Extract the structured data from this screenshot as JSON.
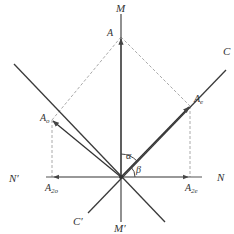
{
  "diagram": {
    "type": "vector-projection",
    "colors": {
      "line": "#3a3a3a",
      "axis": "#555555",
      "dashed": "#aaaaaa",
      "text": "#333333"
    },
    "labels": {
      "M": "M",
      "M_prime": "M′",
      "N": "N",
      "N_prime": "N′",
      "C": "C",
      "C_prime": "C′",
      "A": "A",
      "A_e": "A",
      "A_e_sub": "e",
      "A_o": "A",
      "A_o_sub": "o",
      "A_2o": "A",
      "A_2o_sub": "2o",
      "A_2e": "A",
      "A_2e_sub": "2e",
      "alpha": "α",
      "beta": "β"
    }
  }
}
